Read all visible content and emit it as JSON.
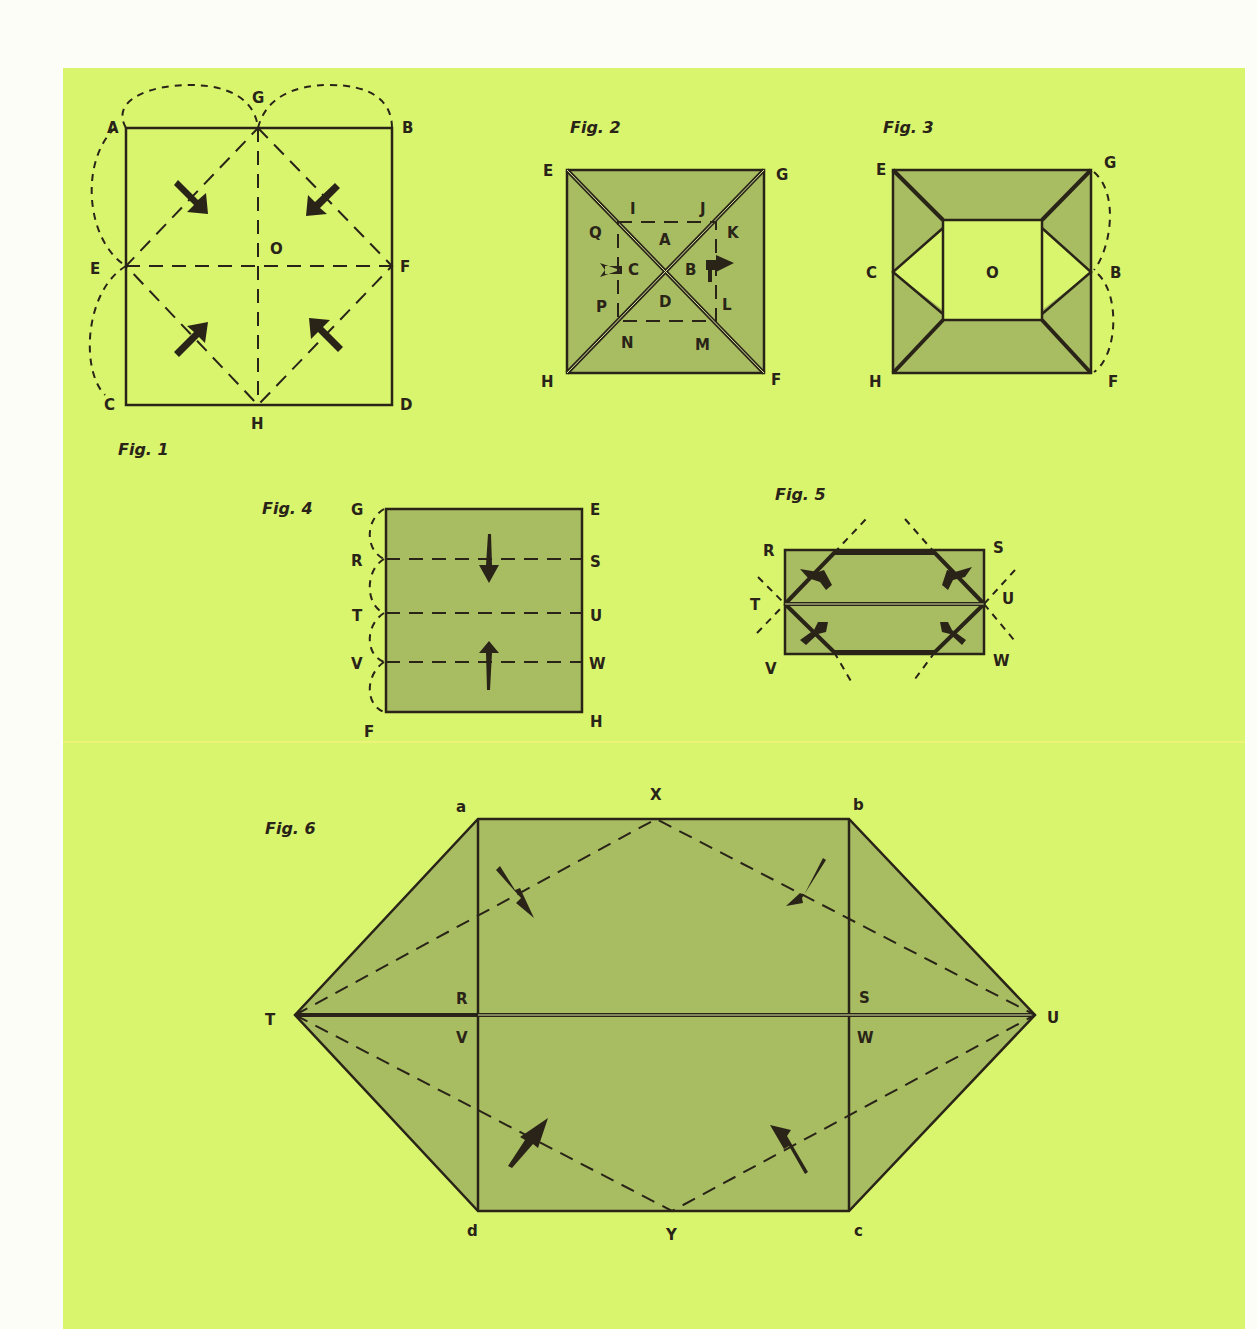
{
  "colors": {
    "page_background": "#fdfdf8",
    "panel_background": "#d9f56e",
    "paper_shade": "#a8bd62",
    "ink": "#2a2418"
  },
  "figures": {
    "fig1": {
      "caption": "Fig. 1",
      "points": {
        "A": "A",
        "B": "B",
        "C": "C",
        "D": "D",
        "E": "E",
        "F": "F",
        "G": "G",
        "H": "H",
        "O": "O"
      }
    },
    "fig2": {
      "caption": "Fig. 2",
      "points": {
        "E": "E",
        "G": "G",
        "H": "H",
        "F": "F",
        "I": "I",
        "J": "J",
        "K": "K",
        "Q": "Q",
        "A": "A",
        "C": "C",
        "B": "B",
        "P": "P",
        "D": "D",
        "L": "L",
        "N": "N",
        "M": "M"
      }
    },
    "fig3": {
      "caption": "Fig. 3",
      "points": {
        "E": "E",
        "G": "G",
        "C": "C",
        "O": "O",
        "B": "B",
        "H": "H",
        "F": "F"
      }
    },
    "fig4": {
      "caption": "Fig. 4",
      "points": {
        "G": "G",
        "E": "E",
        "R": "R",
        "S": "S",
        "T": "T",
        "U": "U",
        "V": "V",
        "W": "W",
        "F": "F",
        "H": "H"
      }
    },
    "fig5": {
      "caption": "Fig. 5",
      "points": {
        "R": "R",
        "S": "S",
        "T": "T",
        "U": "U",
        "V": "V",
        "W": "W"
      }
    },
    "fig6": {
      "caption": "Fig. 6",
      "points": {
        "a": "a",
        "X": "X",
        "b": "b",
        "R": "R",
        "S": "S",
        "T": "T",
        "U": "U",
        "V": "V",
        "W": "W",
        "d": "d",
        "Y": "Y",
        "c": "c"
      }
    }
  }
}
